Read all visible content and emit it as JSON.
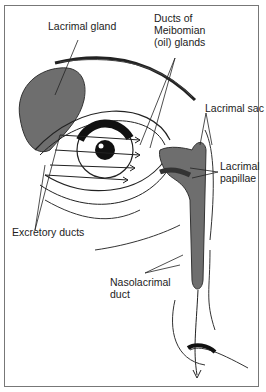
{
  "diagram": {
    "type": "anatomical-illustration",
    "labels": {
      "lacrimal_gland": "Lacrimal gland",
      "meibomian_1": "Ducts of",
      "meibomian_2": "Meibomian",
      "meibomian_3": "(oil) glands",
      "lacrimal_sac": "Lacrimal sac",
      "lacrimal_papillae_1": "Lacrimal",
      "lacrimal_papillae_2": "papillae",
      "excretory_ducts": "Excretory ducts",
      "nasolacrimal_1": "Nasolacrimal",
      "nasolacrimal_2": "duct"
    },
    "colors": {
      "line": "#222222",
      "gland_fill": "#6e6e6e",
      "frame": "#777777"
    }
  }
}
